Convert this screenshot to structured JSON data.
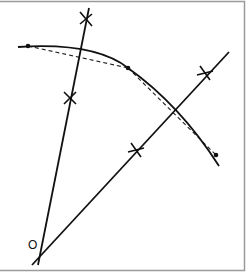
{
  "diagram": {
    "type": "geometric-construction",
    "origin_label": "O",
    "colors": {
      "stroke": "#111111",
      "frame": "#9a9a9a",
      "background": "#ffffff"
    },
    "elements": {
      "ray_1": {
        "from": [
          38,
          265
        ],
        "to": [
          89,
          8
        ],
        "tick_marks": [
          [
            86,
            18
          ],
          [
            70,
            98
          ]
        ]
      },
      "ray_2": {
        "from": [
          32,
          265
        ],
        "to": [
          229,
          52
        ],
        "tick_marks": [
          [
            205,
            73
          ],
          [
            136,
            150
          ]
        ]
      },
      "arc": {
        "points": [
          [
            18,
            47
          ],
          [
            128,
            68
          ],
          [
            219,
            166
          ]
        ],
        "dots": [
          [
            28,
            46
          ],
          [
            128,
            68
          ],
          [
            216,
            155
          ]
        ]
      },
      "dashed_chords": [
        [
          [
            28,
            46
          ],
          [
            128,
            68
          ]
        ],
        [
          [
            128,
            68
          ],
          [
            216,
            155
          ]
        ]
      ]
    }
  }
}
